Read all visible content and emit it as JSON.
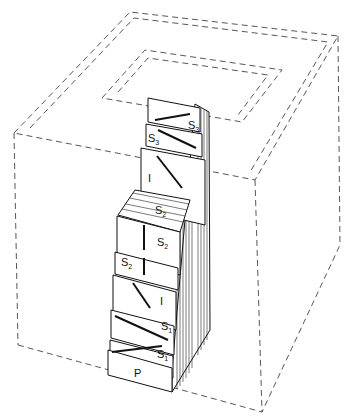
{
  "diagram": {
    "layers": [
      {
        "id": "P",
        "label": "P"
      },
      {
        "id": "S1a",
        "label": "S",
        "sub": "1"
      },
      {
        "id": "S1b",
        "label": "S",
        "sub": "1"
      },
      {
        "id": "I1",
        "label": "I"
      },
      {
        "id": "S2a",
        "label": "S",
        "sub": "2"
      },
      {
        "id": "S2b",
        "label": "S",
        "sub": "2"
      },
      {
        "id": "S2c",
        "label": "S",
        "sub": "2"
      },
      {
        "id": "I2",
        "label": "I"
      },
      {
        "id": "S3a",
        "label": "S",
        "sub": "3"
      },
      {
        "id": "S3b",
        "label": "S",
        "sub": "3"
      }
    ],
    "colors": {
      "line": "#111111",
      "dash": "#444444",
      "background": "#ffffff"
    }
  }
}
